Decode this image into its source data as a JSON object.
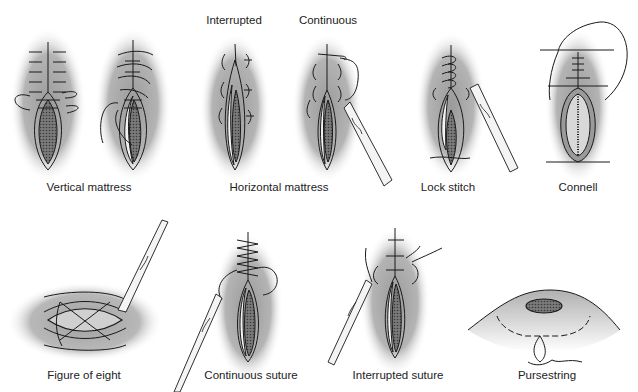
{
  "figure": {
    "background": "#ffffff",
    "skin_shade": "#a9a9a9",
    "line_color": "#1a1a1a",
    "panels": [
      {
        "id": "vertical-mattress",
        "label": "Vertical mattress",
        "variants": 2
      },
      {
        "id": "horizontal-mattress",
        "label": "Horizontal mattress",
        "variants": 2,
        "sub_labels": [
          "Interrupted",
          "Continuous"
        ]
      },
      {
        "id": "lock-stitch",
        "label": "Lock stitch",
        "variants": 1
      },
      {
        "id": "connell",
        "label": "Connell",
        "variants": 1
      },
      {
        "id": "figure-of-eight",
        "label": "Figure of eight",
        "variants": 1
      },
      {
        "id": "continuous-suture",
        "label": "Continuous suture",
        "variants": 1
      },
      {
        "id": "interrupted-suture",
        "label": "Interrupted suture",
        "variants": 1
      },
      {
        "id": "pursestring",
        "label": "Pursestring",
        "variants": 1
      }
    ]
  },
  "labels": {
    "vertical_mattress": "Vertical mattress",
    "interrupted": "Interrupted",
    "continuous": "Continuous",
    "horizontal_mattress": "Horizontal mattress",
    "lock_stitch": "Lock stitch",
    "connell": "Connell",
    "figure_of_eight": "Figure of eight",
    "continuous_suture": "Continuous suture",
    "interrupted_suture": "Interrupted suture",
    "pursestring": "Pursestring"
  }
}
